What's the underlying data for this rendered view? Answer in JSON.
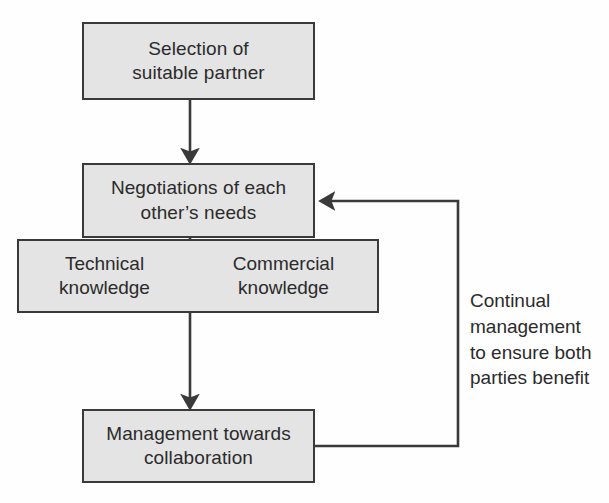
{
  "diagram": {
    "background_color": "#fefefe",
    "node_fill_color": "#e4e4e4",
    "node_border_color": "#3a3a3a",
    "text_color": "#2b2b2b",
    "nodes": {
      "selection": {
        "label": "Selection of\nsuitable partner",
        "line1": "Selection of",
        "line2": "suitable partner"
      },
      "negotiations": {
        "label": "Negotiations of each\nother’s needs",
        "line1": "Negotiations of each",
        "line2": "other’s needs"
      },
      "technical_knowledge": {
        "label": "Technical\nknowledge",
        "line1": "Technical",
        "line2": "knowledge"
      },
      "commercial_knowledge": {
        "label": "Commercial\nknowledge",
        "line1": "Commercial",
        "line2": "knowledge"
      },
      "management": {
        "label": "Management towards\ncollaboration",
        "line1": "Management towards",
        "line2": "collaboration"
      }
    },
    "annotations": {
      "feedback_loop": {
        "label": "Continual\nmanagement\nto ensure both\nparties benefit",
        "line1": "Continual",
        "line2": "management",
        "line3": "to ensure both",
        "line4": "parties benefit"
      }
    },
    "edges": [
      {
        "name": "selection-to-negotiations",
        "from": "selection",
        "to": "negotiations",
        "style": "arrow-down"
      },
      {
        "name": "negotiations-to-management",
        "from": "negotiations",
        "to": "management",
        "style": "arrow-down"
      },
      {
        "name": "management-feedback-to-negotiations",
        "from": "management",
        "to": "negotiations",
        "style": "arrow-loop-right"
      }
    ]
  }
}
